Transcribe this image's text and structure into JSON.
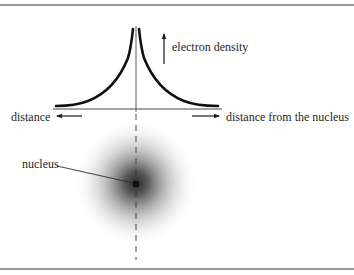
{
  "figure": {
    "type": "electron-density-diagram",
    "labels": {
      "electron_density": "electron density",
      "distance_left": "distance",
      "distance_right": "distance from the nucleus",
      "nucleus": "nucleus"
    },
    "colors": {
      "curve": "#111111",
      "axis": "#333333",
      "frame_rule": "#9a9a9a",
      "cloud_center": "#2a2a2a",
      "background": "#ffffff"
    },
    "plot": {
      "description": "Symmetric cusp-shaped electron density curve peaking at the nucleus and decaying with distance on both sides",
      "x_axis": "distance from the nucleus",
      "y_axis": "electron density"
    }
  }
}
